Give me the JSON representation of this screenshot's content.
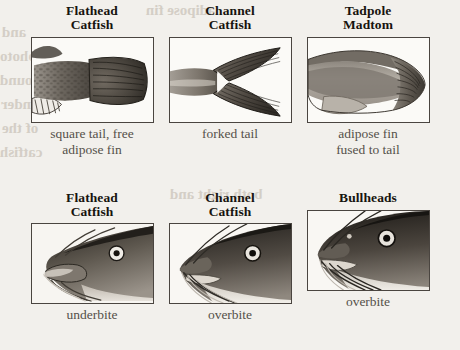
{
  "page": {
    "background_color": "#f2f0ec",
    "ink_color": "#17140f",
    "caption_color": "#55504a",
    "frame_border_color": "#4a4540"
  },
  "bleed_through": {
    "note": "faint mirrored show-through text from the reverse side of the printed page",
    "color": "#cfc9c0",
    "lines": [
      {
        "text": "and",
        "x": 2,
        "y": 24,
        "size": 15
      },
      {
        "text": "photo",
        "x": 0,
        "y": 48,
        "size": 15
      },
      {
        "text": "found",
        "x": 0,
        "y": 72,
        "size": 15
      },
      {
        "text": "under",
        "x": 1,
        "y": 96,
        "size": 15
      },
      {
        "text": "of the",
        "x": 2,
        "y": 120,
        "size": 15
      },
      {
        "text": "catfish",
        "x": 0,
        "y": 144,
        "size": 15
      },
      {
        "text": "adipose fin",
        "x": 146,
        "y": 2,
        "size": 15
      },
      {
        "text": "said",
        "x": 182,
        "y": 56,
        "size": 15
      },
      {
        "text": "U",
        "x": 246,
        "y": 74,
        "size": 15
      },
      {
        "text": "both right and",
        "x": 170,
        "y": 186,
        "size": 15
      },
      {
        "text": "B",
        "x": 340,
        "y": 220,
        "size": 15
      }
    ]
  },
  "figure": {
    "rows": [
      {
        "id": "tail-comparison",
        "cells": [
          {
            "id": "flathead-tail",
            "species": "Flathead\nCatfish",
            "image_alt": "flathead catfish square tail with free adipose fin",
            "caption": "square tail, free\nadipose fin"
          },
          {
            "id": "channel-tail",
            "species": "Channel\nCatfish",
            "image_alt": "channel catfish deeply forked tail",
            "caption": "forked tail"
          },
          {
            "id": "tadpole-madtom-tail",
            "species": "Tadpole\nMadtom",
            "image_alt": "tadpole madtom adipose fin fused to the tail",
            "caption": "adipose fin\nfused to tail"
          }
        ]
      },
      {
        "id": "jaw-comparison",
        "cells": [
          {
            "id": "flathead-jaw",
            "species": "Flathead\nCatfish",
            "image_alt": "flathead catfish head in profile showing projecting lower jaw",
            "caption": "underbite"
          },
          {
            "id": "channel-jaw",
            "species": "Channel\nCatfish",
            "image_alt": "channel catfish head in profile showing projecting upper jaw",
            "caption": "overbite"
          },
          {
            "id": "bullheads-jaw",
            "species": "Bullheads",
            "image_alt": "bullhead catfish head in profile showing projecting upper jaw",
            "caption": "overbite"
          }
        ]
      }
    ]
  }
}
